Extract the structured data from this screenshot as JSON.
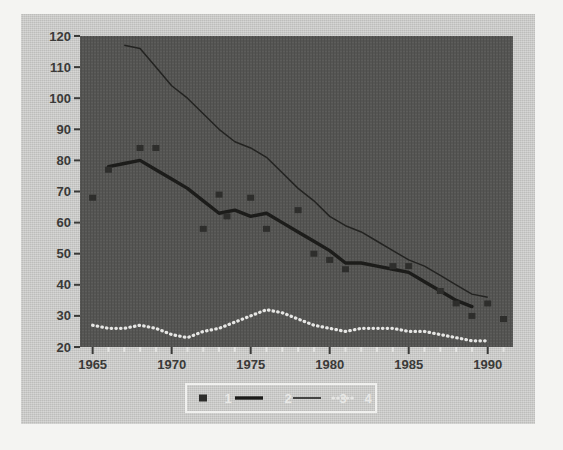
{
  "chart_data": {
    "type": "line",
    "title": "",
    "xlabel": "",
    "ylabel": "",
    "xlim": [
      1964.2,
      1991.6
    ],
    "ylim": [
      20,
      120
    ],
    "xticks": [
      1965,
      1970,
      1975,
      1980,
      1985,
      1990
    ],
    "xtick_labels": [
      "1965",
      "1970",
      "1975",
      "1980",
      "1985",
      "1990"
    ],
    "yticks": [
      20,
      30,
      40,
      50,
      60,
      70,
      80,
      90,
      100,
      110,
      120
    ],
    "ytick_labels": [
      "20",
      "30",
      "40",
      "50",
      "60",
      "70",
      "80",
      "90",
      "100",
      "110",
      "120"
    ],
    "grid": false,
    "legend_position": "bottom-center",
    "plot_bg": "#555553",
    "panel_bg": "#c9c9c7",
    "series": [
      {
        "name": "1",
        "label": "1",
        "style": "markers",
        "marker": "square",
        "color": "#2e2e2c",
        "x": [
          1965,
          1966,
          1968,
          1969,
          1972,
          1973,
          1973.5,
          1975,
          1976,
          1978,
          1979,
          1980,
          1981,
          1984,
          1985,
          1987,
          1988,
          1989,
          1990,
          1991
        ],
        "y": [
          68,
          77,
          84,
          84,
          58,
          69,
          62,
          68,
          58,
          64,
          50,
          48,
          45,
          46,
          46,
          38,
          34,
          30,
          34,
          29
        ]
      },
      {
        "name": "2",
        "label": "2",
        "style": "thick-line",
        "color": "#1c1c1a",
        "x": [
          1966,
          1967,
          1968,
          1969,
          1970,
          1971,
          1972,
          1973,
          1974,
          1975,
          1976,
          1977,
          1978,
          1979,
          1980,
          1981,
          1982,
          1983,
          1984,
          1985,
          1986,
          1987,
          1988,
          1989
        ],
        "y": [
          78,
          79,
          80,
          77,
          74,
          71,
          67,
          63,
          64,
          62,
          63,
          60,
          57,
          54,
          51,
          47,
          47,
          46,
          45,
          44,
          41,
          38,
          35,
          33
        ]
      },
      {
        "name": "3",
        "label": "3",
        "style": "thin-line",
        "color": "#232321",
        "x": [
          1967,
          1968,
          1969,
          1970,
          1971,
          1972,
          1973,
          1974,
          1975,
          1976,
          1977,
          1978,
          1979,
          1980,
          1981,
          1982,
          1983,
          1984,
          1985,
          1986,
          1987,
          1988,
          1989,
          1990
        ],
        "y": [
          117,
          116,
          110,
          104,
          100,
          95,
          90,
          86,
          84,
          81,
          76,
          71,
          67,
          62,
          59,
          57,
          54,
          51,
          48,
          46,
          43,
          40,
          37,
          36
        ]
      },
      {
        "name": "4",
        "label": "4",
        "style": "dotted-line",
        "color": "#e6e6e4",
        "x": [
          1965,
          1966,
          1967,
          1968,
          1969,
          1970,
          1971,
          1972,
          1973,
          1974,
          1975,
          1976,
          1977,
          1978,
          1979,
          1980,
          1981,
          1982,
          1983,
          1984,
          1985,
          1986,
          1987,
          1988,
          1989,
          1990
        ],
        "y": [
          27,
          26,
          26,
          27,
          26,
          24,
          23,
          25,
          26,
          28,
          30,
          32,
          31,
          29,
          27,
          26,
          25,
          26,
          26,
          26,
          25,
          25,
          24,
          23,
          22,
          22
        ]
      }
    ]
  },
  "legend": {
    "entries": [
      {
        "label": "1",
        "marker": "square-marker"
      },
      {
        "label": "2",
        "marker": "thick-line-swatch"
      },
      {
        "label": "3",
        "marker": "thin-line-swatch"
      },
      {
        "label": "4",
        "marker": "dotted-line-swatch"
      }
    ]
  },
  "colors": {
    "plot_background": "#555553",
    "panel_background": "#c9c9c7",
    "page_background": "#f4f4f2",
    "axis_text": "#3a3a38",
    "legend_text": "#e8e8e6",
    "legend_border": "#f0f0ee",
    "series_1": "#2e2e2c",
    "series_2": "#1c1c1a",
    "series_3": "#232321",
    "series_4": "#e6e6e4"
  }
}
